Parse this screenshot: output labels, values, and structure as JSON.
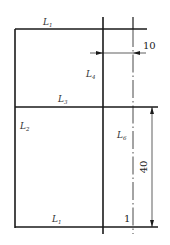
{
  "diagram": {
    "labels": {
      "top": {
        "main": "L",
        "sub": "1"
      },
      "inner_vertical": {
        "main": "L",
        "sub": "4"
      },
      "middle": {
        "main": "L",
        "sub": "3"
      },
      "left_lower": {
        "main": "L",
        "sub": "2"
      },
      "right_lower": {
        "main": "L",
        "sub": "6"
      },
      "bottom": {
        "main": "L",
        "sub": "1"
      }
    },
    "dimensions": {
      "horizontal_offset": "10",
      "vertical_height": "40"
    },
    "marker": "1",
    "colors": {
      "line": "#1a1a1a",
      "background": "#ffffff"
    }
  }
}
